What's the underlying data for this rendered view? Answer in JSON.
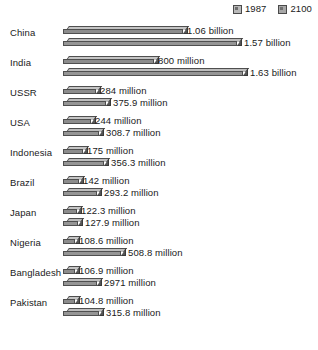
{
  "legend": {
    "entries": [
      {
        "label": "1987",
        "swatch": "legend-swatch-1987",
        "color": "#b9b9b9"
      },
      {
        "label": "2100",
        "swatch": "legend-swatch-2100",
        "color": "#a8a8a8"
      }
    ]
  },
  "chart_data": {
    "type": "bar",
    "orientation": "horizontal",
    "title": "",
    "subtitle": "",
    "xlabel": "",
    "ylabel": "",
    "grid": false,
    "legend_position": "top-right",
    "units": "people",
    "axis_visible": false,
    "tick_labels": [],
    "xlim": [
      0,
      1630
    ],
    "categories": [
      "China",
      "India",
      "USSR",
      "USA",
      "Indonesia",
      "Brazil",
      "Japan",
      "Nigeria",
      "Bangladesh",
      "Pakistan"
    ],
    "series": [
      {
        "name": "1987",
        "color": "#8c8c8c",
        "values": [
          1060,
          800,
          284,
          244,
          175,
          142,
          122.3,
          108.6,
          106.9,
          104.8
        ],
        "labels": [
          "1.06 billion",
          "800 million",
          "284 million",
          "244 million",
          "175 million",
          "142 million",
          "122.3 million",
          "108.6 million",
          "106.9 million",
          "104.8 million"
        ]
      },
      {
        "name": "2100",
        "color": "#959595",
        "values": [
          1570,
          1630,
          375.9,
          308.7,
          356.3,
          293.2,
          127.9,
          508.8,
          297.1,
          315.8
        ],
        "labels": [
          "1.57 billion",
          "1.63 billion",
          "375.9 million",
          "308.7 million",
          "356.3 million",
          "293.2 million",
          "127.9 million",
          "508.8 million",
          "2971 million",
          "315.8 million"
        ]
      }
    ]
  },
  "rows": [
    {
      "label": "China",
      "bar1987": {
        "value_label": "1.06 billion",
        "width_px": 120,
        "label_x": 124
      },
      "bar2100": {
        "value_label": "1.57 billion",
        "width_px": 174,
        "label_x": 181
      }
    },
    {
      "label": "India",
      "bar1987": {
        "value_label": "800 million",
        "width_px": 91,
        "label_x": 95
      },
      "bar2100": {
        "value_label": "1.63 billion",
        "width_px": 180,
        "label_x": 187
      }
    },
    {
      "label": "USSR",
      "bar1987": {
        "value_label": "284 million",
        "width_px": 33,
        "label_x": 37
      },
      "bar2100": {
        "value_label": "375.9 million",
        "width_px": 43,
        "label_x": 50
      }
    },
    {
      "label": "USA",
      "bar1987": {
        "value_label": "244 million",
        "width_px": 28,
        "label_x": 32
      },
      "bar2100": {
        "value_label": "308.7 million",
        "width_px": 36,
        "label_x": 43
      }
    },
    {
      "label": "Indonesia",
      "bar1987": {
        "value_label": "175 million",
        "width_px": 20,
        "label_x": 24
      },
      "bar2100": {
        "value_label": "356.3 million",
        "width_px": 41,
        "label_x": 48
      }
    },
    {
      "label": "Brazil",
      "bar1987": {
        "value_label": "142 million",
        "width_px": 16,
        "label_x": 20
      },
      "bar2100": {
        "value_label": "293.2 million",
        "width_px": 34,
        "label_x": 41
      }
    },
    {
      "label": "Japan",
      "bar1987": {
        "value_label": "122.3 million",
        "width_px": 14,
        "label_x": 18
      },
      "bar2100": {
        "value_label": "127.9 million",
        "width_px": 15,
        "label_x": 22
      }
    },
    {
      "label": "Nigeria",
      "bar1987": {
        "value_label": "108.6 million",
        "width_px": 12,
        "label_x": 16
      },
      "bar2100": {
        "value_label": "508.8 million",
        "width_px": 58,
        "label_x": 65
      }
    },
    {
      "label": "Bangladesh",
      "bar1987": {
        "value_label": "106.9 million",
        "width_px": 12,
        "label_x": 16
      },
      "bar2100": {
        "value_label": "2971 million",
        "width_px": 34,
        "label_x": 41
      }
    },
    {
      "label": "Pakistan",
      "bar1987": {
        "value_label": "104.8 million",
        "width_px": 12,
        "label_x": 16
      },
      "bar2100": {
        "value_label": "315.8 million",
        "width_px": 36,
        "label_x": 43
      }
    }
  ]
}
